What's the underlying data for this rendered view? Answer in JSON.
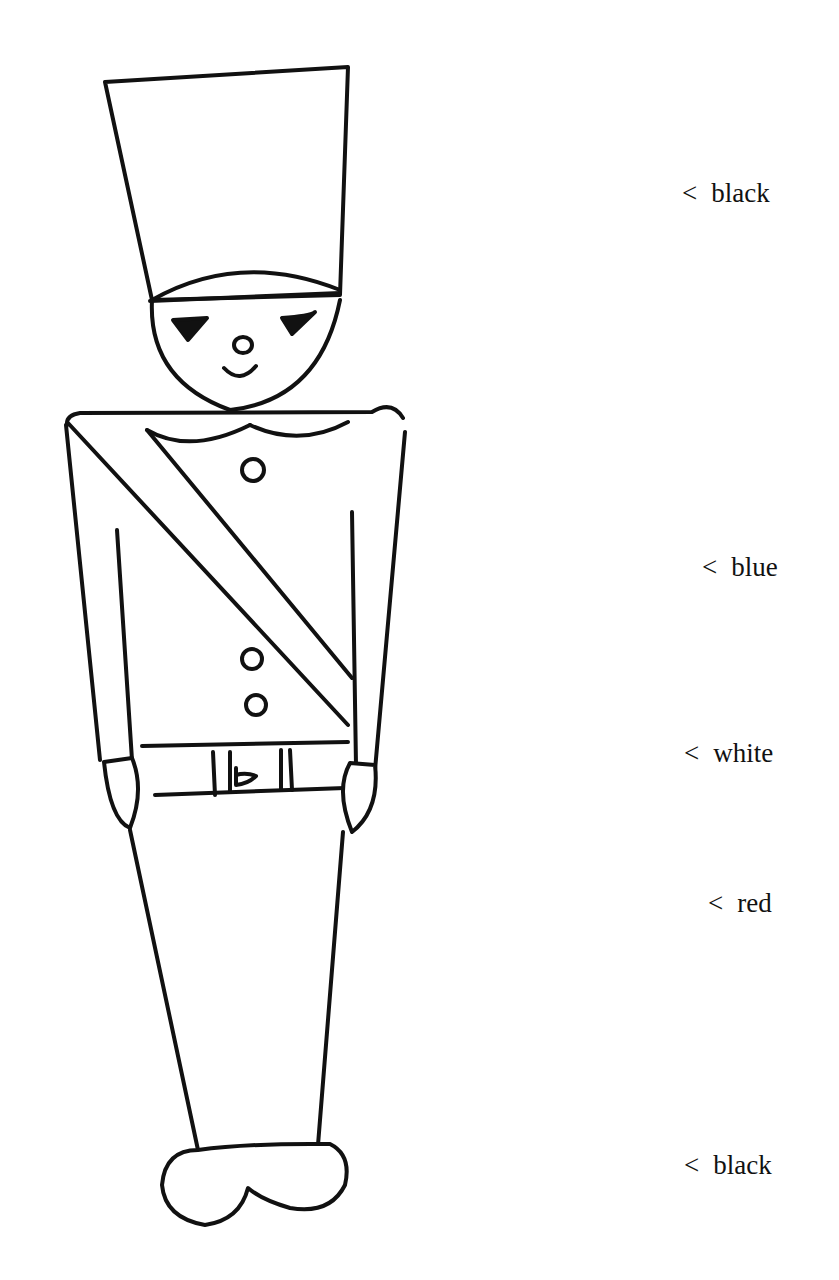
{
  "figure": {
    "line_color": "#111111",
    "background": "#ffffff"
  },
  "labels": [
    {
      "arrow": "<",
      "text": "black",
      "target": "hat"
    },
    {
      "arrow": "<",
      "text": "blue",
      "target": "jacket"
    },
    {
      "arrow": "<",
      "text": "white",
      "target": "belt"
    },
    {
      "arrow": "<",
      "text": "red",
      "target": "trousers"
    },
    {
      "arrow": "<",
      "text": "black",
      "target": "shoes"
    }
  ]
}
